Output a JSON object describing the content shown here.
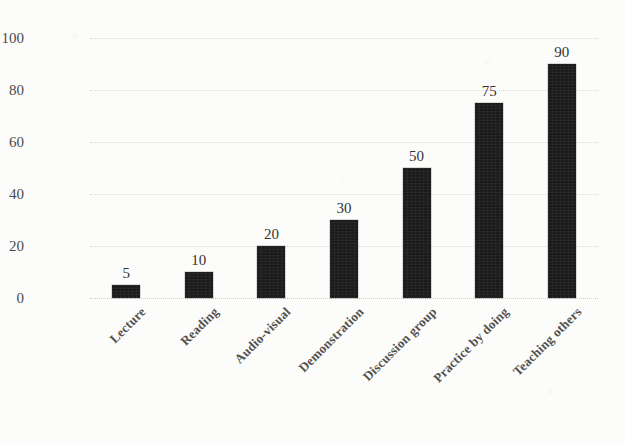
{
  "chart_data": {
    "type": "bar",
    "title": "",
    "xlabel": "",
    "ylabel": "Percentage retention (%)",
    "categories": [
      "Lecture",
      "Reading",
      "Audio-visual",
      "Demonstration",
      "Discussion group",
      "Practice by doing",
      "Teaching others"
    ],
    "values": [
      5,
      10,
      20,
      30,
      50,
      75,
      90
    ],
    "data_labels": [
      "5",
      "10",
      "20",
      "30",
      "50",
      "75",
      "90"
    ],
    "ylim": [
      0,
      100
    ],
    "yticks": [
      0,
      20,
      40,
      60,
      80,
      100
    ],
    "ytick_labels": [
      "0",
      "20",
      "40",
      "60",
      "80",
      "100"
    ],
    "grid": true,
    "grid_axis": "y",
    "grid_style": "dotted",
    "legend": false,
    "legend_position": "none",
    "bar_color": "#1b1b1b",
    "grid_color": "#d8d8d6",
    "background_color": "#fcfcfb",
    "text_color": "#4a4a4a"
  }
}
